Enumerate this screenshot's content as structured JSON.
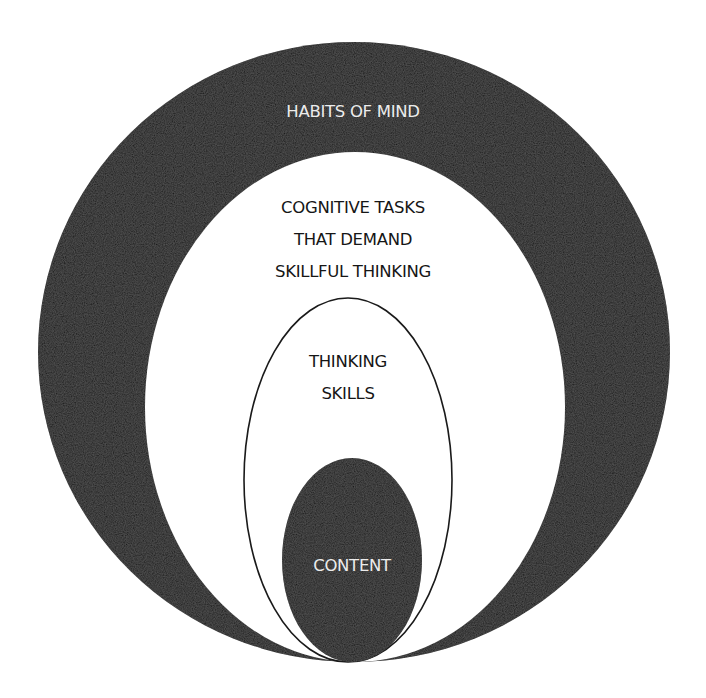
{
  "diagram": {
    "colors": {
      "background": "#ffffff",
      "dark_fill": "#141414",
      "light_fill": "#ffffff",
      "outline": "#1a1a1a",
      "light_text": "#ececec",
      "dark_text": "#161616"
    },
    "layers": [
      {
        "id": "habits-of-mind",
        "label": "HABITS OF MIND",
        "fill": "dark",
        "order": 1
      },
      {
        "id": "cognitive-tasks",
        "label": "COGNITIVE TASKS\nTHAT DEMAND\nSKILLFUL THINKING",
        "lines": [
          "COGNITIVE TASKS",
          "THAT DEMAND",
          "SKILLFUL THINKING"
        ],
        "fill": "light",
        "order": 2
      },
      {
        "id": "thinking-skills",
        "label": "THINKING\nSKILLS",
        "lines": [
          "THINKING",
          "SKILLS"
        ],
        "fill": "light-outlined",
        "order": 3
      },
      {
        "id": "content",
        "label": "CONTENT",
        "fill": "dark",
        "order": 4
      }
    ]
  }
}
